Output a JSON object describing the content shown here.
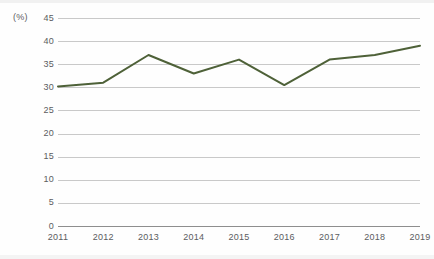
{
  "chart_data": {
    "type": "line",
    "title": "",
    "subtitle": "",
    "xlabel": "",
    "ylabel": "",
    "unit_label": "(%)",
    "categories": [
      "2011",
      "2012",
      "2013",
      "2014",
      "2015",
      "2016",
      "2017",
      "2018",
      "2019"
    ],
    "values": [
      30.2,
      31.0,
      37.0,
      33.0,
      36.0,
      30.5,
      36.0,
      37.0,
      39.0
    ],
    "series": [
      {
        "name": "",
        "values": [
          30.2,
          31.0,
          37.0,
          33.0,
          36.0,
          30.5,
          36.0,
          37.0,
          39.0
        ]
      }
    ],
    "ylim": [
      0,
      45
    ],
    "ytick_step": 5,
    "ytick_labels": [
      "45",
      "40",
      "35",
      "30",
      "25",
      "20",
      "15",
      "10",
      "5",
      "0"
    ],
    "ytick_values": [
      45,
      40,
      35,
      30,
      25,
      20,
      15,
      10,
      5,
      0
    ],
    "xtick_labels": [
      "2011",
      "2012",
      "2013",
      "2014",
      "2015",
      "2016",
      "2017",
      "2018",
      "2019"
    ],
    "grid": true,
    "grid_axis": "y",
    "legend": false,
    "legend_position": "none",
    "colors": {
      "line": "#4e6138",
      "grid": "#c9c9c9",
      "baseline": "#8e8e8e",
      "text": "#5b5c5e",
      "background": "#fefefe"
    }
  }
}
